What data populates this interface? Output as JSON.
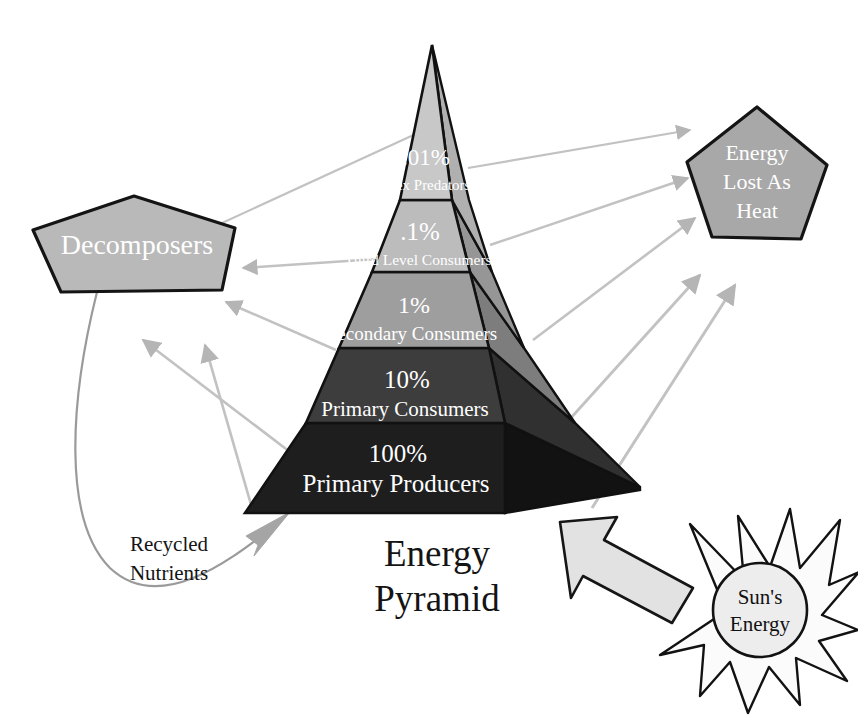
{
  "title": {
    "line1": "Energy",
    "line2": "Pyramid"
  },
  "pyramid": {
    "tiers": [
      {
        "percent": ".01%",
        "name": "Apex Predators",
        "front_color": "#c8c8c8",
        "side_color": "#b0b0b0"
      },
      {
        "percent": ".1%",
        "name": "Third Level Consumers",
        "front_color": "#bcbcbc",
        "side_color": "#969696"
      },
      {
        "percent": "1%",
        "name": "Secondary Consumers",
        "front_color": "#9e9e9e",
        "side_color": "#7d7d7d"
      },
      {
        "percent": "10%",
        "name": "Primary Consumers",
        "front_color": "#3d3d3d",
        "side_color": "#4e4e4e"
      },
      {
        "percent": "100%",
        "name": "Primary Producers",
        "front_color": "#1e1e1e",
        "side_color": "#121212"
      }
    ]
  },
  "nodes": {
    "decomposers": {
      "label": "Decomposers",
      "fill": "#b9b9b9"
    },
    "heat": {
      "label_line1": "Energy",
      "label_line2": "Lost As",
      "label_line3": "Heat",
      "fill": "#a8a8a8"
    },
    "sun": {
      "label_line1": "Sun's",
      "label_line2": "Energy",
      "fill": "#eeeeee"
    }
  },
  "flows": {
    "recycled_nutrients": {
      "line1": "Recycled",
      "line2": "Nutrients"
    }
  },
  "colors": {
    "outline": "#111111",
    "arrow_gray": "#b5b5b5",
    "curve_gray": "#9a9a9a",
    "background": "#ffffff"
  }
}
